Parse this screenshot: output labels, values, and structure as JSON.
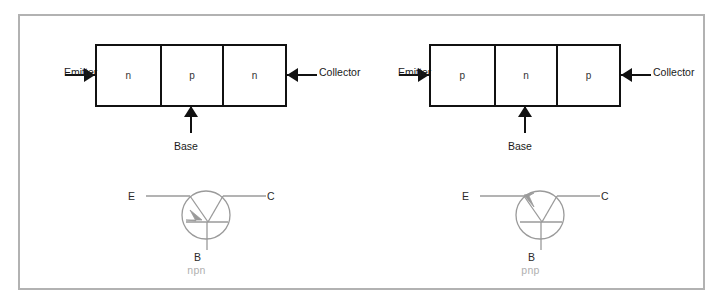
{
  "figure": {
    "border_color": "#b2b2b2",
    "background": "#ffffff",
    "symbol_stroke": "#9a9a9a",
    "block_stroke": "#111111",
    "type_label_color": "#b0b0b0"
  },
  "panels": [
    {
      "type_label": "npn",
      "structure": {
        "segments": [
          {
            "label": "n"
          },
          {
            "label": "p"
          },
          {
            "label": "n"
          }
        ],
        "terminals": {
          "emitter": "Emitter",
          "base": "Base",
          "collector": "Collector"
        }
      },
      "symbol": {
        "emitter_pin": "E",
        "collector_pin": "C",
        "base_pin": "B",
        "arrow_on": "emitter",
        "arrow_direction": "toward-base-bar"
      }
    },
    {
      "type_label": "pnp",
      "structure": {
        "segments": [
          {
            "label": "p"
          },
          {
            "label": "n"
          },
          {
            "label": "p"
          }
        ],
        "terminals": {
          "emitter": "Emitter",
          "base": "Base",
          "collector": "Collector"
        }
      },
      "symbol": {
        "emitter_pin": "E",
        "collector_pin": "C",
        "base_pin": "B",
        "arrow_on": "emitter",
        "arrow_direction": "away-from-base-bar"
      }
    }
  ],
  "caption_sliver": ""
}
